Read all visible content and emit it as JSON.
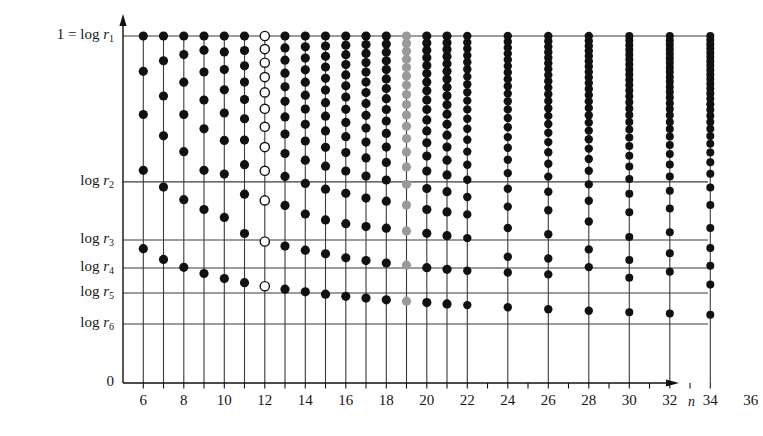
{
  "chart_data": {
    "type": "scatter",
    "title": "",
    "xlabel": "n",
    "ylabel": "",
    "xlim": [
      5,
      37
    ],
    "ylim": [
      0,
      1
    ],
    "grid": true,
    "legend": null,
    "y_axis": {
      "tick_values": [
        1,
        0.5794,
        0.4121,
        0.3314,
        0.2594,
        0.17,
        0
      ],
      "tick_labels": [
        "1 = log r",
        "log r",
        "log r",
        "log r",
        "log r",
        "log r",
        "0"
      ],
      "tick_subscripts": [
        "1",
        "2",
        "3",
        "4",
        "5",
        "6",
        ""
      ],
      "gridline_values": [
        1,
        0.5794,
        0.4121,
        0.3314,
        0.2594,
        0.17
      ]
    },
    "x_axis": {
      "tick_values": [
        6,
        7,
        8,
        9,
        10,
        11,
        12,
        13,
        14,
        15,
        16,
        17,
        18,
        19,
        20,
        21,
        22,
        23,
        24,
        25,
        26,
        27,
        28,
        29,
        30,
        31,
        32,
        33,
        34,
        35,
        36
      ],
      "labeled_ticks": [
        6,
        8,
        10,
        12,
        14,
        16,
        18,
        20,
        22,
        24,
        26,
        28,
        30,
        32,
        34,
        36
      ],
      "labels": [
        "6",
        "8",
        "10",
        "12",
        "14",
        "16",
        "18",
        "20",
        "22",
        "24",
        "26",
        "28",
        "30",
        "32",
        "34",
        "36"
      ]
    },
    "series": [
      {
        "name": "n=6",
        "x": 6,
        "marker": "filled",
        "values": [
          1,
          0.8982,
          0.7737,
          0.6131,
          0.3869,
          0.0
        ]
      },
      {
        "name": "n=7",
        "x": 7,
        "marker": "filled",
        "values": [
          1,
          0.9286,
          0.8271,
          0.7124,
          0.5646,
          0.3562,
          0.0
        ]
      },
      {
        "name": "n=8",
        "x": 8,
        "marker": "filled",
        "values": [
          1,
          0.9464,
          0.8668,
          0.7739,
          0.6667,
          0.5283,
          0.3333,
          0.0
        ]
      },
      {
        "name": "n=9",
        "x": 9,
        "marker": "filled",
        "values": [
          1,
          0.9591,
          0.8962,
          0.8155,
          0.7325,
          0.6131,
          0.5,
          0.3155,
          0.0
        ]
      },
      {
        "name": "n=10",
        "x": 10,
        "marker": "filled",
        "values": [
          1,
          0.9542,
          0.9031,
          0.8451,
          0.7782,
          0.699,
          0.6021,
          0.4771,
          0.301,
          0.0
        ]
      },
      {
        "name": "n=11",
        "x": 11,
        "marker": "filled",
        "values": [
          1,
          0.9582,
          0.9141,
          0.8672,
          0.8167,
          0.7615,
          0.6999,
          0.6292,
          0.5442,
          0.4307,
          0.2891,
          0.0
        ]
      },
      {
        "name": "n=12",
        "x": 12,
        "marker": "open",
        "values": [
          1,
          0.9623,
          0.923,
          0.8816,
          0.8376,
          0.7903,
          0.7384,
          0.6799,
          0.6114,
          0.5262,
          0.4079,
          0.2789,
          0.0
        ]
      },
      {
        "name": "n=13",
        "x": 13,
        "marker": "filled",
        "values": [
          1,
          0.9658,
          0.9302,
          0.8929,
          0.8537,
          0.8119,
          0.7668,
          0.7173,
          0.6614,
          0.5955,
          0.5118,
          0.3945,
          0.2702,
          0.0
        ]
      },
      {
        "name": "n=14",
        "x": 14,
        "marker": "filled",
        "values": [
          1,
          0.9688,
          0.9363,
          0.9025,
          0.867,
          0.8294,
          0.7892,
          0.7456,
          0.6973,
          0.642,
          0.5753,
          0.4869,
          0.3827,
          0.2627,
          0.0
        ]
      },
      {
        "name": "n=15",
        "x": 15,
        "marker": "filled",
        "values": [
          1,
          0.9713,
          0.9415,
          0.9106,
          0.8782,
          0.8441,
          0.8079,
          0.769,
          0.7266,
          0.6793,
          0.6249,
          0.5585,
          0.47,
          0.3722,
          0.256,
          0.0
        ]
      },
      {
        "name": "n=16",
        "x": 16,
        "marker": "filled",
        "values": [
          1,
          0.9734,
          0.946,
          0.9175,
          0.8878,
          0.8566,
          0.8238,
          0.7888,
          0.7511,
          0.7099,
          0.6639,
          0.611,
          0.5466,
          0.4591,
          0.3607,
          0.25,
          0.0
        ]
      },
      {
        "name": "n=17",
        "x": 17,
        "marker": "filled",
        "values": [
          1,
          0.9753,
          0.9498,
          0.9234,
          0.896,
          0.8673,
          0.8372,
          0.8054,
          0.7714,
          0.7346,
          0.6942,
          0.6488,
          0.5962,
          0.5329,
          0.4506,
          0.3528,
          0.2447,
          0.0
        ]
      },
      {
        "name": "n=18",
        "x": 18,
        "marker": "filled",
        "values": [
          1,
          0.9769,
          0.9532,
          0.9286,
          0.9031,
          0.8765,
          0.8486,
          0.8194,
          0.7883,
          0.7551,
          0.7193,
          0.6799,
          0.6357,
          0.5849,
          0.5239,
          0.4462,
          0.3459,
          0.2399,
          0.0
        ]
      },
      {
        "name": "n=19",
        "x": 19,
        "marker": "grey",
        "values": [
          1,
          0.9783,
          0.9561,
          0.9331,
          0.9092,
          0.8844,
          0.8584,
          0.8313,
          0.8026,
          0.7722,
          0.7397,
          0.7046,
          0.6659,
          0.6227,
          0.5727,
          0.5128,
          0.4384,
          0.3396,
          0.2356,
          0.0
        ]
      },
      {
        "name": "n=20",
        "x": 20,
        "marker": "filled",
        "values": [
          1,
          0.9796,
          0.9587,
          0.9372,
          0.9149,
          0.8917,
          0.8676,
          0.8424,
          0.8159,
          0.7881,
          0.7583,
          0.7266,
          0.6921,
          0.6539,
          0.6108,
          0.5606,
          0.5,
          0.4315,
          0.3323,
          0.2316,
          0.0
        ]
      },
      {
        "name": "n=21",
        "x": 21,
        "marker": "filled",
        "values": [
          1,
          0.9807,
          0.961,
          0.9408,
          0.9199,
          0.8982,
          0.8757,
          0.8523,
          0.8277,
          0.8019,
          0.7745,
          0.7454,
          0.7141,
          0.6799,
          0.6422,
          0.5998,
          0.5513,
          0.4932,
          0.4244,
          0.3276,
          0.228,
          0.0
        ]
      },
      {
        "name": "n=22",
        "x": 22,
        "marker": "filled",
        "values": [
          1,
          0.9816,
          0.963,
          0.9439,
          0.9243,
          0.904,
          0.8829,
          0.8609,
          0.838,
          0.8139,
          0.7884,
          0.7614,
          0.7325,
          0.7012,
          0.667,
          0.629,
          0.5858,
          0.536,
          0.4859,
          0.4177,
          0.3236,
          0.2246,
          0.0
        ]
      },
      {
        "name": "n=24",
        "x": 24,
        "marker": "filled",
        "values": [
          1,
          0.9833,
          0.9664,
          0.9492,
          0.9315,
          0.9134,
          0.8947,
          0.8753,
          0.8551,
          0.834,
          0.8119,
          0.7885,
          0.7637,
          0.7372,
          0.7087,
          0.6777,
          0.6435,
          0.6049,
          0.5598,
          0.5084,
          0.4467,
          0.364,
          0.3183,
          0.2181,
          0.0
        ]
      },
      {
        "name": "n=26",
        "x": 26,
        "marker": "filled",
        "values": [
          1,
          0.9846,
          0.9691,
          0.9534,
          0.9375,
          0.9212,
          0.9045,
          0.8874,
          0.8697,
          0.8514,
          0.8324,
          0.8125,
          0.7917,
          0.7697,
          0.7463,
          0.7213,
          0.6943,
          0.6648,
          0.632,
          0.5948,
          0.5512,
          0.498,
          0.4284,
          0.3589,
          0.3129,
          0.2128,
          0.0
        ]
      },
      {
        "name": "n=28",
        "x": 28,
        "marker": "filled",
        "values": [
          1,
          0.9857,
          0.9713,
          0.9568,
          0.9422,
          0.9273,
          0.9121,
          0.8966,
          0.8807,
          0.8643,
          0.8474,
          0.8298,
          0.8114,
          0.7922,
          0.7719,
          0.7504,
          0.7274,
          0.7026,
          0.6755,
          0.6455,
          0.6117,
          0.5724,
          0.5252,
          0.4655,
          0.3849,
          0.334,
          0.2081,
          0.0
        ]
      },
      {
        "name": "n=30",
        "x": 30,
        "marker": "filled",
        "values": [
          1,
          0.9866,
          0.9731,
          0.9595,
          0.9458,
          0.932,
          0.9179,
          0.9036,
          0.889,
          0.874,
          0.8586,
          0.8427,
          0.8262,
          0.8091,
          0.7911,
          0.7722,
          0.7522,
          0.7308,
          0.7077,
          0.6826,
          0.6549,
          0.6237,
          0.5878,
          0.5452,
          0.4921,
          0.4208,
          0.3548,
          0.3036,
          0.2041,
          0.0
        ]
      },
      {
        "name": "n=32",
        "x": 32,
        "marker": "filled",
        "values": [
          1,
          0.9874,
          0.9747,
          0.9619,
          0.9491,
          0.9361,
          0.923,
          0.9096,
          0.8961,
          0.8822,
          0.868,
          0.8534,
          0.8383,
          0.8227,
          0.8064,
          0.7894,
          0.7715,
          0.7525,
          0.7322,
          0.7102,
          0.6863,
          0.6598,
          0.6299,
          0.5953,
          0.5541,
          0.5027,
          0.4346,
          0.3737,
          0.3208,
          0.2,
          0.0
        ]
      },
      {
        "name": "n=34",
        "x": 34,
        "marker": "filled",
        "values": [
          1,
          0.9881,
          0.9761,
          0.964,
          0.9519,
          0.9397,
          0.9273,
          0.9148,
          0.9021,
          0.8891,
          0.8759,
          0.8623,
          0.8484,
          0.834,
          0.8191,
          0.8036,
          0.7874,
          0.7703,
          0.7522,
          0.7329,
          0.7121,
          0.6894,
          0.6643,
          0.636,
          0.6031,
          0.5634,
          0.5134,
          0.4463,
          0.3892,
          0.3378,
          0.2835,
          0.1966,
          0.0
        ]
      },
      {
        "name": "n=36",
        "x": 36,
        "marker": "filled",
        "values": [
          1,
          0.9887,
          0.9773,
          0.9658,
          0.9542,
          0.9426,
          0.9308,
          0.9189,
          0.9069,
          0.8947,
          0.8823,
          0.8696,
          0.8567,
          0.8434,
          0.8298,
          0.8157,
          0.8011,
          0.7859,
          0.77,
          0.7533,
          0.7355,
          0.7165,
          0.6958,
          0.6732,
          0.6481,
          0.6194,
          0.586,
          0.5455,
          0.4941,
          0.4272,
          0.3693,
          0.318,
          0.2737,
          0.1934,
          0.0
        ]
      }
    ]
  },
  "axis": {
    "y_labels": [
      {
        "prefix": "1 = log ",
        "root": "r",
        "sub": "1",
        "value": 1
      },
      {
        "prefix": "log ",
        "root": "r",
        "sub": "2",
        "value": 0.5794
      },
      {
        "prefix": "log ",
        "root": "r",
        "sub": "3",
        "value": 0.4121
      },
      {
        "prefix": "log ",
        "root": "r",
        "sub": "4",
        "value": 0.3314
      },
      {
        "prefix": "log ",
        "root": "r",
        "sub": "5",
        "value": 0.2594
      },
      {
        "prefix": "log ",
        "root": "r",
        "sub": "6",
        "value": 0.17
      },
      {
        "prefix": "0",
        "root": "",
        "sub": "",
        "value": 0
      }
    ],
    "x_name": "n",
    "x_tick_labels": [
      "6",
      "8",
      "10",
      "12",
      "14",
      "16",
      "18",
      "20",
      "22",
      "24",
      "26",
      "28",
      "30",
      "32",
      "34",
      "36"
    ]
  },
  "style": {
    "dot_color": "#111111",
    "open_dot_fill": "#ffffff",
    "grey_dot_color": "#9a9a9a",
    "line_color": "#3a3a3a",
    "axis_color": "#111111",
    "background": "#ffffff"
  }
}
